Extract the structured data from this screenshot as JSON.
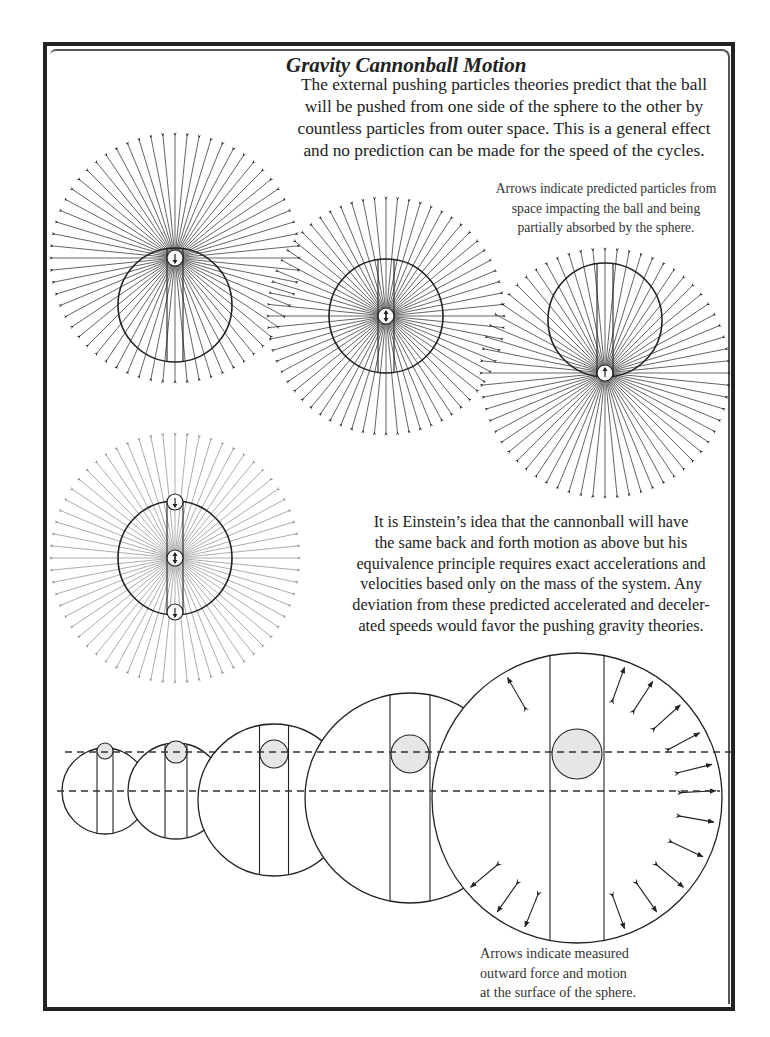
{
  "title": "Gravity Cannonball Motion",
  "intro_lines": [
    "The external pushing particles theories predict that the ball",
    "will be pushed from one side of the sphere to the other by",
    "countless particles from outer space. This is a general effect",
    "and no prediction can be made for the speed of the cycles."
  ],
  "caption_predicted_lines": [
    "Arrows indicate predicted particles from",
    "space impacting the ball and being",
    "partially absorbed by the sphere."
  ],
  "caption_einstein_lines": [
    "It is Einstein’s idea that the cannonball will have",
    "the same back and forth motion as above but his",
    "equivalence principle requires exact accelerations and",
    "velocities based only on the mass of the system. Any",
    "deviation from these predicted accelerated and deceler-",
    "ated speeds would favor the pushing gravity theories."
  ],
  "caption_measured_lines": [
    "Arrows indicate measured",
    "outward force and motion",
    "at the surface of the sphere."
  ],
  "colors": {
    "ink": "#222222",
    "faint_ink": "#8a8a8a",
    "ball_fill": "#e6e6e6"
  },
  "particle_diagrams": [
    {
      "name": "ball-top-diagram",
      "cx": 175,
      "cy": 258,
      "ray_radius": 124,
      "ray_count": 64,
      "sphere_cx": 175,
      "sphere_cy": 305,
      "sphere_r": 57,
      "ball_y": 258,
      "ball_arrow": "down",
      "faint": false
    },
    {
      "name": "ball-center-diagram",
      "cx": 386,
      "cy": 316,
      "ray_radius": 118,
      "ray_count": 64,
      "sphere_cx": 386,
      "sphere_cy": 316,
      "sphere_r": 57,
      "ball_y": 316,
      "ball_arrow": "both",
      "faint": false
    },
    {
      "name": "ball-bottom-diagram",
      "cx": 605,
      "cy": 373,
      "ray_radius": 124,
      "ray_count": 64,
      "sphere_cx": 605,
      "sphere_cy": 320,
      "sphere_r": 57,
      "ball_y": 373,
      "ball_arrow": "up",
      "faint": false
    },
    {
      "name": "einstein-diagram",
      "cx": 175,
      "cy": 558,
      "ray_radius": 124,
      "ray_count": 64,
      "sphere_cx": 175,
      "sphere_cy": 558,
      "sphere_r": 57,
      "ball_y": 558,
      "ball_arrow": "both",
      "faint": true,
      "extra_balls": [
        {
          "y": 502,
          "arrow": "down"
        },
        {
          "y": 612,
          "arrow": "down"
        }
      ]
    }
  ],
  "growth_spheres": [
    {
      "cx": 105,
      "cy": 791,
      "r": 43,
      "shaft_w": 16,
      "ball_cy": 751,
      "ball_r": 8
    },
    {
      "cx": 176,
      "cy": 791,
      "r": 48,
      "shaft_w": 22,
      "ball_cy": 752,
      "ball_r": 11
    },
    {
      "cx": 274,
      "cy": 800,
      "r": 76,
      "shaft_w": 29,
      "ball_cy": 754,
      "ball_r": 14
    },
    {
      "cx": 410,
      "cy": 798,
      "r": 105,
      "shaft_w": 40,
      "ball_cy": 754,
      "ball_r": 19
    },
    {
      "cx": 577,
      "cy": 798,
      "r": 145,
      "shaft_w": 54,
      "ball_cy": 754,
      "ball_r": 25
    }
  ],
  "dashed_lines": [
    {
      "x1": 65,
      "x2": 733,
      "y": 752
    },
    {
      "x1": 57,
      "x2": 720,
      "y": 791
    }
  ],
  "outward_arrow_angles_deg": [
    -120,
    -105,
    -93,
    -82,
    -70,
    -57,
    -42,
    -28,
    -14,
    -3,
    10,
    25,
    40,
    55,
    70,
    85,
    100,
    112,
    125,
    140
  ]
}
